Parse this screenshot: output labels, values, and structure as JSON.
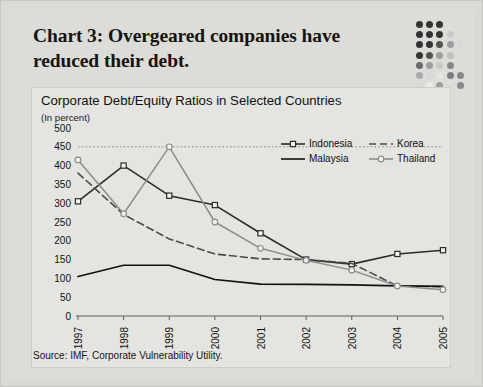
{
  "headline": "Chart 3: Overgeared companies have reduced their debt.",
  "source": "Source: IMF, Corporate Vulnerability Utility.",
  "colors": {
    "page_bg": "#d9d9d6",
    "panel_bg": "#e4e4e0",
    "ink": "#16140f",
    "indonesia": "#2b2b2b",
    "korea": "#4a4a4a",
    "malaysia": "#111111",
    "thailand": "#8c8c8c",
    "gridline": "#8d8d8d"
  },
  "chart_data": {
    "type": "line",
    "title": "Corporate Debt/Equity Ratios in Selected Countries",
    "subtitle": "(In percent)",
    "xlabel": "",
    "ylabel": "",
    "units": "(In percent)",
    "categories": [
      "1997",
      "1998",
      "1999",
      "2000",
      "2001",
      "2002",
      "2003",
      "2004",
      "2005"
    ],
    "x": [
      1997,
      1998,
      1999,
      2000,
      2001,
      2002,
      2003,
      2004,
      2005
    ],
    "ylim": [
      0,
      500
    ],
    "yticks": [
      0,
      50,
      100,
      150,
      200,
      250,
      300,
      350,
      400,
      450,
      500
    ],
    "ytick_labels": [
      "0",
      "50",
      "100",
      "150",
      "200",
      "250",
      "300",
      "350",
      "400",
      "450",
      "500"
    ],
    "grid": "single dotted reference line at 450",
    "gridlines": [
      450
    ],
    "legend_position": "upper-right inside plot",
    "series": [
      {
        "name": "Indonesia",
        "style": "solid-dark-with-open-square-markers",
        "marker": "open-square",
        "color": "#2b2b2b",
        "values": [
          305,
          400,
          320,
          295,
          220,
          150,
          138,
          165,
          175
        ]
      },
      {
        "name": "Korea",
        "style": "dashed",
        "marker": "none",
        "color": "#4a4a4a",
        "values": [
          380,
          270,
          205,
          165,
          152,
          150,
          140,
          80,
          78
        ]
      },
      {
        "name": "Malaysia",
        "style": "solid-dark-no-marker",
        "marker": "none",
        "color": "#111111",
        "values": [
          105,
          135,
          135,
          97,
          85,
          84,
          83,
          80,
          79
        ]
      },
      {
        "name": "Thailand",
        "style": "solid-gray-with-open-circle-markers",
        "marker": "open-circle",
        "color": "#8c8c8c",
        "values": [
          415,
          272,
          450,
          250,
          180,
          148,
          122,
          80,
          70
        ]
      }
    ]
  },
  "legend": {
    "rows": [
      [
        {
          "label": "Indonesia",
          "key": "line-open-square"
        },
        {
          "label": "Korea",
          "key": "line-dashed"
        }
      ],
      [
        {
          "label": "Malaysia",
          "key": "line-solid"
        },
        {
          "label": "Thailand",
          "key": "line-open-circle"
        }
      ]
    ]
  },
  "dot_matrix": {
    "name": "decorative-dot-grid",
    "cols": 5,
    "rows": 7
  }
}
